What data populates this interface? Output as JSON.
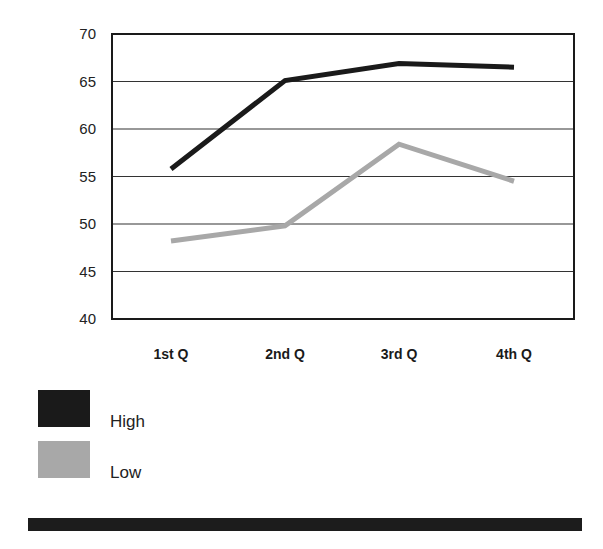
{
  "chart_data": {
    "type": "line",
    "title": "",
    "xlabel": "",
    "ylabel": "",
    "categories": [
      "1st Q",
      "2nd Q",
      "3rd Q",
      "4th Q"
    ],
    "ylim": [
      40,
      70
    ],
    "yticks": [
      40,
      45,
      50,
      55,
      60,
      65,
      70
    ],
    "grid": true,
    "legend_position": "bottom-left",
    "series": [
      {
        "name": "High",
        "color": "#1a1a1a",
        "values": [
          55.8,
          65.1,
          66.9,
          66.5
        ]
      },
      {
        "name": "Low",
        "color": "#a8a8a8",
        "values": [
          48.2,
          49.8,
          58.4,
          54.5
        ]
      }
    ]
  },
  "decor": {
    "bottom_bar_color": "#1c1c1c"
  }
}
